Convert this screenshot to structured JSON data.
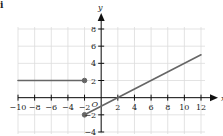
{
  "panel_label": "i",
  "chart_data": {
    "type": "line",
    "title": "",
    "xlabel": "x",
    "ylabel": "y",
    "origin_label": "O",
    "xlim": [
      -10,
      12
    ],
    "ylim": [
      -4,
      8
    ],
    "grid": true,
    "x_ticks": [
      -10,
      -8,
      -6,
      -4,
      -2,
      2,
      4,
      6,
      8,
      10,
      12
    ],
    "y_ticks": [
      8,
      6,
      4,
      2,
      -2,
      -4
    ],
    "x_tick_labels": [
      "−10",
      "−8",
      "−6",
      "−4",
      "−2",
      "2",
      "4",
      "6",
      "8",
      "10",
      "12"
    ],
    "y_tick_labels": [
      "8",
      "6",
      "4",
      "2",
      "−2",
      "−4"
    ],
    "series": [
      {
        "name": "piece-1",
        "points": [
          [
            -10,
            2
          ],
          [
            -2,
            2
          ]
        ],
        "endpoint_dots": [
          {
            "x": -2,
            "y": 2,
            "closed": true
          }
        ]
      },
      {
        "name": "piece-2",
        "points": [
          [
            -2,
            -2
          ],
          [
            12,
            5
          ]
        ],
        "endpoint_dots": [
          {
            "x": -2,
            "y": -2,
            "closed": true
          }
        ]
      }
    ],
    "colors": {
      "line": "#666666",
      "grid": "#dcdcdc",
      "axis": "#111111"
    }
  }
}
